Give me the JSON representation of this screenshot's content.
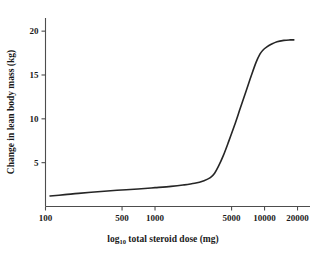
{
  "chart_data": {
    "type": "line",
    "title": "",
    "xlabel": "log10 total steroid dose (mg)",
    "xlabel_base": "log",
    "xlabel_sub": "10",
    "xlabel_rest": " total steroid dose (mg)",
    "ylabel": "Change in lean body mass (kg)",
    "xscale": "log",
    "xlim": [
      100,
      26000
    ],
    "ylim": [
      0,
      21.5
    ],
    "xticks": [
      100,
      500,
      1000,
      5000,
      10000,
      20000
    ],
    "xtick_labels": [
      "100",
      "500",
      "1000",
      "5000",
      "10000",
      "20000"
    ],
    "yticks": [
      5,
      10,
      15,
      20
    ],
    "ytick_labels": [
      "5",
      "10",
      "15",
      "20"
    ],
    "grid": false,
    "legend": false,
    "line_color": "#262626",
    "axis_color": "#4d4d4d",
    "series": [
      {
        "name": "Change in lean body mass",
        "x": [
          110,
          150,
          200,
          300,
          450,
          700,
          1000,
          1400,
          1800,
          2300,
          2800,
          3200,
          3500,
          3800,
          4200,
          4700,
          5300,
          6000,
          6800,
          7600,
          8400,
          9100,
          9600,
          10500,
          11500,
          13000,
          15000,
          17000,
          18500
        ],
        "y": [
          1.2,
          1.35,
          1.5,
          1.68,
          1.85,
          2.0,
          2.15,
          2.3,
          2.45,
          2.65,
          2.95,
          3.3,
          3.8,
          4.6,
          5.8,
          7.4,
          9.2,
          11.2,
          13.2,
          15.0,
          16.5,
          17.4,
          17.8,
          18.2,
          18.5,
          18.8,
          18.95,
          19.0,
          19.0
        ]
      }
    ]
  }
}
